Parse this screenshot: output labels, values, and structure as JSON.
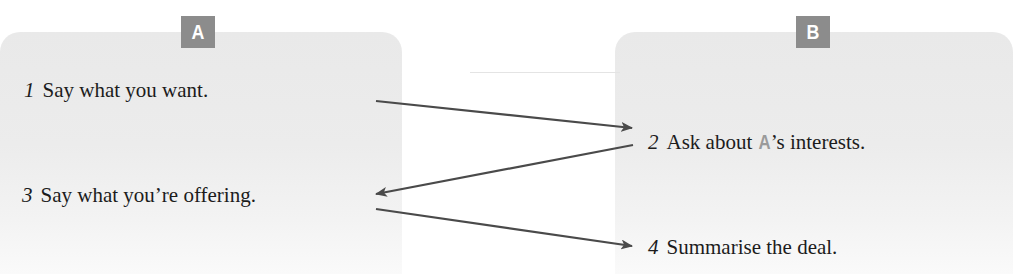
{
  "diagram": {
    "panels": [
      {
        "id": "A",
        "badge_label": "A"
      },
      {
        "id": "B",
        "badge_label": "B"
      }
    ],
    "steps": [
      {
        "number": "1",
        "text": "Say what you want.",
        "panel": "A"
      },
      {
        "number": "2",
        "text_before": "Ask about ",
        "ref": "A",
        "text_after": "’s interests.",
        "panel": "B"
      },
      {
        "number": "3",
        "text": "Say what you’re offering.",
        "panel": "A"
      },
      {
        "number": "4",
        "text": "Summarise the deal.",
        "panel": "B"
      }
    ],
    "arrows": [
      {
        "from": "1",
        "to": "2",
        "direction": "right"
      },
      {
        "from": "2",
        "to": "3",
        "direction": "left"
      },
      {
        "from": "3",
        "to": "4",
        "direction": "right"
      }
    ],
    "colors": {
      "panel_fill": "#ebebeb",
      "badge_fill": "#8c8c8c",
      "badge_text": "#ffffff",
      "arrow": "#4a4a4a",
      "ref_letter": "#9a9a9a",
      "text": "#1c1c1c"
    }
  }
}
